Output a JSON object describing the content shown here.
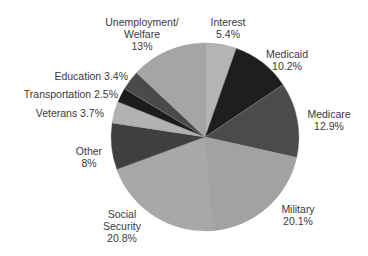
{
  "chart_data": {
    "type": "pie",
    "title": "",
    "start_angle_deg": 0,
    "direction": "clockwise",
    "slices": [
      {
        "label": "Interest",
        "value": 5.4,
        "display": "5.4%",
        "color": "#b4b4b4"
      },
      {
        "label": "Medicaid",
        "value": 10.2,
        "display": "10.2%",
        "color": "#1e1e1e"
      },
      {
        "label": "Medicare",
        "value": 12.9,
        "display": "12.9%",
        "color": "#4b4b4b"
      },
      {
        "label": "Military",
        "value": 20.1,
        "display": "20.1%",
        "color": "#a2a2a2"
      },
      {
        "label": "Social Security",
        "value": 20.8,
        "display": "20.8%",
        "color": "#a8a8a8"
      },
      {
        "label": "Other",
        "value": 8,
        "display": "8%",
        "color": "#3f3f3f"
      },
      {
        "label": "Veterans",
        "value": 3.7,
        "display": "3.7%",
        "color": "#b2b2b2"
      },
      {
        "label": "Transportation",
        "value": 2.5,
        "display": "2.5%",
        "color": "#1c1c1c"
      },
      {
        "label": "Education",
        "value": 3.4,
        "display": "3.4%",
        "color": "#4a4a4a"
      },
      {
        "label": "Unemployment/Welfare",
        "value": 13,
        "display": "13%",
        "color": "#a5a5a5"
      }
    ]
  },
  "labels": {
    "interest": {
      "line1": "Interest",
      "line2": "5.4%"
    },
    "medicaid": {
      "line1": "Medicaid",
      "line2": "10.2%"
    },
    "medicare": {
      "line1": "Medicare",
      "line2": "12.9%"
    },
    "military": {
      "line1": "Military",
      "line2": "20.1%"
    },
    "social_security": {
      "line1": "Social",
      "line2": "Security",
      "line3": "20.8%"
    },
    "other": {
      "line1": "Other",
      "line2": "8%"
    },
    "veterans": {
      "line1": "Veterans 3.7%"
    },
    "transportation": {
      "line1": "Transportation 2.5%"
    },
    "education": {
      "line1": "Education 3.4%"
    },
    "unemployment": {
      "line1": "Unemployment/",
      "line2": "Welfare",
      "line3": "13%"
    }
  }
}
